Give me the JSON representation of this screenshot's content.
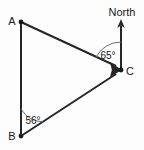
{
  "figure": {
    "background_color": "#fdfdfd",
    "line_color": "#262626",
    "arc_color": "#6d6d6d",
    "text_color": "#1a1a1a",
    "vertices": [
      {
        "name": "A",
        "label": "A",
        "x": 21,
        "y": 22,
        "label_x": 12,
        "label_y": 22
      },
      {
        "name": "B",
        "label": "B",
        "x": 21,
        "y": 136,
        "label_x": 12,
        "label_y": 137
      },
      {
        "name": "C",
        "label": "C",
        "x": 121,
        "y": 70,
        "label_x": 130,
        "label_y": 72
      }
    ],
    "direction_marker": {
      "label": "North",
      "label_x": 122,
      "label_y": 13,
      "arrow_from_x": 121,
      "arrow_from_y": 70,
      "arrow_to_x": 121,
      "arrow_to_y": 20
    },
    "segments": [
      {
        "name": "segment-AB",
        "from": "A",
        "to": "B",
        "arrow": false
      },
      {
        "name": "segment-AC",
        "from": "A",
        "to": "C",
        "arrow": true
      },
      {
        "name": "segment-BC",
        "from": "B",
        "to": "C",
        "arrow": true
      }
    ],
    "angles": [
      {
        "name": "angle-at-C",
        "label": "65°",
        "value": 65,
        "unit": "degrees",
        "vertex": "C",
        "label_x": 108,
        "label_y": 56,
        "between": [
          "North",
          "A"
        ]
      },
      {
        "name": "angle-at-B",
        "label": "56°",
        "value": 56,
        "unit": "degrees",
        "vertex": "B",
        "label_x": 33,
        "label_y": 121,
        "between": [
          "A",
          "C"
        ]
      }
    ]
  }
}
